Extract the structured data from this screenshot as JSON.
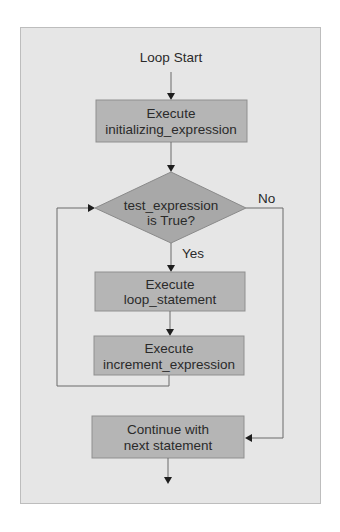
{
  "diagram": {
    "type": "flowchart",
    "start_label": "Loop Start",
    "nodes": [
      {
        "id": "init",
        "shape": "rect",
        "lines": [
          "Execute",
          "initializing_expression"
        ]
      },
      {
        "id": "test",
        "shape": "diamond",
        "lines": [
          "test_expression",
          "is True?"
        ]
      },
      {
        "id": "body",
        "shape": "rect",
        "lines": [
          "Execute",
          "loop_statement"
        ]
      },
      {
        "id": "incr",
        "shape": "rect",
        "lines": [
          "Execute",
          "increment_expression"
        ]
      },
      {
        "id": "next",
        "shape": "rect",
        "lines": [
          "Continue with",
          "next statement"
        ]
      }
    ],
    "edges": [
      {
        "from": "start",
        "to": "init",
        "label": ""
      },
      {
        "from": "init",
        "to": "test",
        "label": ""
      },
      {
        "from": "test",
        "to": "body",
        "label": "Yes"
      },
      {
        "from": "test",
        "to": "next",
        "label": "No"
      },
      {
        "from": "body",
        "to": "incr",
        "label": ""
      },
      {
        "from": "incr",
        "to": "test",
        "label": ""
      },
      {
        "from": "next",
        "to": "end",
        "label": ""
      }
    ],
    "colors": {
      "panel_bg": "#e6e6e6",
      "node_fill": "#b5b5b5",
      "line": "#6a6a6a"
    }
  }
}
